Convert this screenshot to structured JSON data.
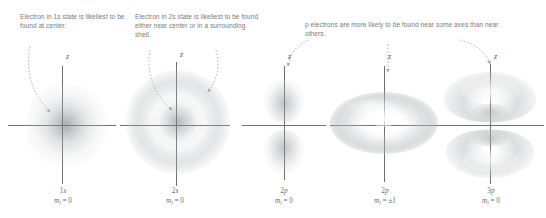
{
  "figure": {
    "captions": [
      {
        "id": "caption-1s",
        "text": "Electron in 1s state is likeliest to be found at center."
      },
      {
        "id": "caption-2s",
        "text": "Electron in 2s state is likeliest to be found either near center or in a surrounding shell."
      },
      {
        "id": "caption-p",
        "text": "p electrons are more likely to be found near some axes than near others."
      }
    ],
    "axis_label": "z",
    "panels": [
      {
        "id": "1s",
        "orbital": "1s",
        "orbital_n": "1",
        "orbital_l": "s",
        "m_symbol": "m",
        "m_subscript": "l",
        "m_value": "= 0",
        "m_full": "m_l = 0",
        "shape": "sphere",
        "description": "dense fuzzy spherical cloud, densest at center"
      },
      {
        "id": "2s",
        "orbital": "2s",
        "orbital_n": "2",
        "orbital_l": "s",
        "m_symbol": "m",
        "m_subscript": "l",
        "m_value": "= 0",
        "m_full": "m_l = 0",
        "shape": "sphere-with-shell",
        "description": "dense core surrounded by a separate outer shell"
      },
      {
        "id": "2p0",
        "orbital": "2p",
        "orbital_n": "2",
        "orbital_l": "p",
        "m_symbol": "m",
        "m_subscript": "l",
        "m_value": "= 0",
        "m_full": "m_l = 0",
        "shape": "dumbbell",
        "description": "two vertical lobes above and below the horizontal axis"
      },
      {
        "id": "2p1",
        "orbital": "2p",
        "orbital_n": "2",
        "orbital_l": "p",
        "m_symbol": "m",
        "m_subscript": "l",
        "m_value": "= ±1",
        "m_full": "m_l = ±1",
        "shape": "torus",
        "description": "donut-shaped ring around the vertical z axis"
      },
      {
        "id": "3p0",
        "orbital": "3p",
        "orbital_n": "3",
        "orbital_l": "p",
        "m_symbol": "m",
        "m_subscript": "l",
        "m_value": "= 0",
        "m_full": "m_l = 0",
        "shape": "double-mushroom",
        "description": "large upper and lower lobes with inner nodal structure"
      }
    ],
    "colors": {
      "cloud": "#8a8c8f",
      "axis": "#6e6f71",
      "text": "#6d6e70",
      "leader": "#a9abad",
      "background": "#ffffff"
    }
  }
}
